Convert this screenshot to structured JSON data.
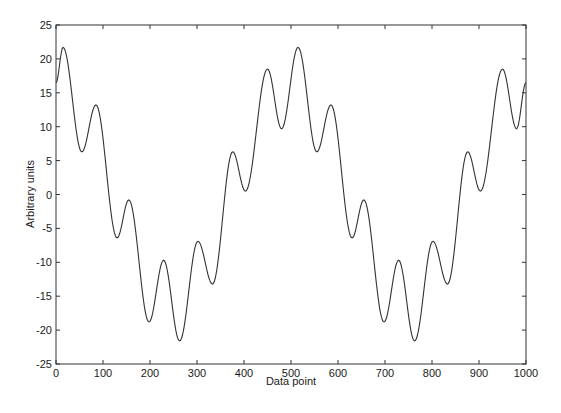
{
  "chart_data": {
    "type": "line",
    "title": "",
    "xlabel": "Data point",
    "ylabel": "Arbitrary units",
    "xlim": [
      0,
      1000
    ],
    "ylim": [
      -25,
      25
    ],
    "xticks": [
      0,
      100,
      200,
      300,
      400,
      500,
      600,
      700,
      800,
      900,
      1000
    ],
    "yticks": [
      -25,
      -20,
      -15,
      -10,
      -5,
      0,
      5,
      10,
      15,
      20,
      25
    ],
    "grid": false,
    "legend": null,
    "line_color": "#333333",
    "period": 500,
    "extrema": [
      [
        0,
        16.5
      ],
      [
        15,
        21.7
      ],
      [
        55,
        6.3
      ],
      [
        85,
        13.2
      ],
      [
        130,
        -6.4
      ],
      [
        155,
        -0.8
      ],
      [
        198,
        -18.8
      ],
      [
        229,
        -9.7
      ],
      [
        263,
        -21.6
      ],
      [
        302,
        -6.9
      ],
      [
        333,
        -13.2
      ],
      [
        376,
        6.3
      ],
      [
        403,
        0.5
      ],
      [
        450,
        18.5
      ],
      [
        480,
        9.7
      ],
      [
        515,
        21.7
      ],
      [
        555,
        6.3
      ],
      [
        585,
        13.2
      ],
      [
        630,
        -6.4
      ],
      [
        655,
        -0.8
      ],
      [
        698,
        -18.8
      ],
      [
        729,
        -9.7
      ],
      [
        763,
        -21.6
      ],
      [
        802,
        -6.9
      ],
      [
        833,
        -13.2
      ],
      [
        876,
        6.3
      ],
      [
        903,
        0.5
      ],
      [
        950,
        18.5
      ],
      [
        980,
        9.7
      ],
      [
        1000,
        16.5
      ]
    ],
    "series": [
      {
        "name": "signal",
        "x_start": 0,
        "x_step": 10,
        "values": [
          16.5,
          20.4,
          21.1,
          16.9,
          11.1,
          6.9,
          6.8,
          9.8,
          12.7,
          12.6,
          8.3,
          1.7,
          -4.1,
          -6.4,
          -4.5,
          -1.3,
          -1.4,
          -5.7,
          -12.1,
          -17.3,
          -18.7,
          -15.8,
          -11.5,
          -9.7,
          -12.5,
          -17.8,
          -21.4,
          -20.5,
          -15.7,
          -10.1,
          -7.0,
          -7.9,
          -10.8,
          -13.1,
          -12.0,
          -6.6,
          0.4,
          5.4,
          6.0,
          3.2,
          0.7,
          1.5,
          5.7,
          11.6,
          16.6,
          18.5,
          16.3,
          11.9,
          9.7,
          12.0,
          16.5,
          20.4,
          21.1,
          16.9,
          11.1,
          6.9,
          6.8,
          9.8,
          12.7,
          12.6,
          8.3,
          1.7,
          -4.1,
          -6.4,
          -4.5,
          -1.3,
          -1.4,
          -5.7,
          -12.1,
          -17.3,
          -18.7,
          -15.8,
          -11.5,
          -9.7,
          -12.5,
          -17.8,
          -21.4,
          -20.5,
          -15.7,
          -10.1,
          -7.0,
          -7.9,
          -10.8,
          -13.1,
          -12.0,
          -6.6,
          0.4,
          5.4,
          6.0,
          3.2,
          0.7,
          1.5,
          5.7,
          11.6,
          16.6,
          18.5,
          16.3,
          11.9,
          9.7,
          12.0,
          16.5
        ]
      }
    ]
  },
  "axes": {
    "xlabel": "Data point",
    "ylabel": "Arbitrary units"
  }
}
